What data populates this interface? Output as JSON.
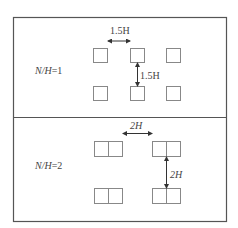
{
  "panels": [
    {
      "label_prefix": "N/H",
      "label_eq": "=1",
      "horizontal_spacing_label": "1.5H",
      "vertical_spacing_label": "1.5H",
      "unit_type": "single-square",
      "rows": 2,
      "cols": 3
    },
    {
      "label_prefix": "N/H",
      "label_eq": "=2",
      "horizontal_spacing_label": "2H",
      "vertical_spacing_label": "2H",
      "unit_type": "double-square",
      "rows": 2,
      "cols": 2
    }
  ],
  "colors": {
    "border": "#555555",
    "box": "#888888",
    "arrow": "#333333",
    "text": "#444444"
  }
}
